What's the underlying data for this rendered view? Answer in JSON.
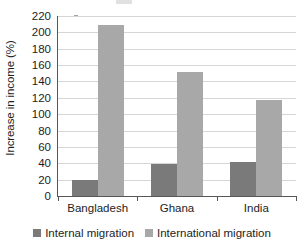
{
  "chart_data": {
    "type": "bar",
    "title": "",
    "subtitle": "",
    "xlabel": "",
    "ylabel": "Increase in income (%)",
    "categories": [
      "Bangladesh",
      "Ghana",
      "India"
    ],
    "series": [
      {
        "name": "Internal migration",
        "color": "#7a7a7a",
        "values": [
          19,
          39,
          41
        ]
      },
      {
        "name": "International migration",
        "color": "#a8a8a8",
        "values": [
          209,
          152,
          117
        ]
      }
    ],
    "ylim": [
      0,
      220
    ],
    "ytick_step": 20,
    "yticks": [
      0,
      20,
      40,
      60,
      80,
      100,
      120,
      140,
      160,
      180,
      200,
      220
    ],
    "ytick_labels": [
      "0",
      "20",
      "40",
      "60",
      "80",
      "100",
      "120",
      "140",
      "160",
      "180",
      "200",
      "220"
    ],
    "grid": "horizontal",
    "legend_position": "bottom",
    "legend_entries": [
      "Internal migration",
      "International migration"
    ],
    "annotations": []
  },
  "colors": {
    "internal": "#7a7a7a",
    "international": "#a8a8a8",
    "axis": "#575757",
    "grid": "#d6d6d6",
    "text": "#1d1d1d",
    "background": "#ffffff"
  }
}
